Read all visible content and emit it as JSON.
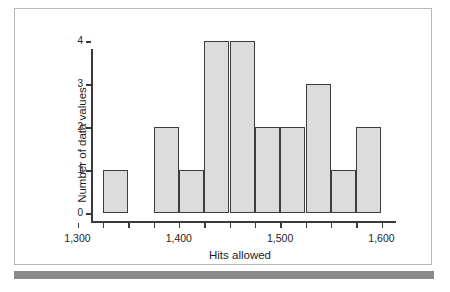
{
  "figure": {
    "frame_border_color": "#b9b9b9",
    "bottom_rule_color": "#8a8a8a",
    "background": "#ffffff"
  },
  "chart_data": {
    "type": "bar",
    "title": "",
    "subtitle": "",
    "xlabel": "Hits allowed",
    "ylabel": "Number of data values",
    "xlim": [
      1300,
      1600
    ],
    "ylim": [
      0,
      4
    ],
    "bin_width": 25,
    "grid": false,
    "legend": null,
    "bar_fill_color": "#dcdcdc",
    "bar_edge_color": "#3d3d3d",
    "x_tick_labels": [
      "1,300",
      "1,400",
      "1,500",
      "1,600"
    ],
    "x_tick_label_values": [
      1300,
      1400,
      1500,
      1600
    ],
    "x_minor_ticks": [
      1300,
      1325,
      1350,
      1375,
      1400,
      1425,
      1450,
      1475,
      1500,
      1525,
      1550,
      1575,
      1600
    ],
    "y_tick_labels": [
      "0",
      "1",
      "2",
      "3",
      "4"
    ],
    "y_tick_values": [
      0,
      1,
      2,
      3,
      4
    ],
    "bins": [
      {
        "start": 1300,
        "end": 1325,
        "count": 0
      },
      {
        "start": 1325,
        "end": 1350,
        "count": 1
      },
      {
        "start": 1350,
        "end": 1375,
        "count": 0
      },
      {
        "start": 1375,
        "end": 1400,
        "count": 2
      },
      {
        "start": 1400,
        "end": 1425,
        "count": 1
      },
      {
        "start": 1425,
        "end": 1450,
        "count": 4
      },
      {
        "start": 1450,
        "end": 1475,
        "count": 4
      },
      {
        "start": 1475,
        "end": 1500,
        "count": 2
      },
      {
        "start": 1500,
        "end": 1525,
        "count": 2
      },
      {
        "start": 1525,
        "end": 1550,
        "count": 3
      },
      {
        "start": 1550,
        "end": 1575,
        "count": 1
      },
      {
        "start": 1575,
        "end": 1600,
        "count": 2
      },
      {
        "start": 1600,
        "end": 1625,
        "count": 2
      },
      {
        "start": 1625,
        "end": 1650,
        "count": 1
      },
      {
        "start": 1650,
        "end": 1675,
        "count": 1
      }
    ],
    "categories": [
      "1325-1350",
      "1375-1400",
      "1400-1425",
      "1425-1450",
      "1450-1475",
      "1475-1500",
      "1500-1525",
      "1525-1550",
      "1550-1575",
      "1575-1600",
      "1600-1625",
      "1625-1650",
      "1650-1675"
    ],
    "values": [
      1,
      2,
      1,
      4,
      4,
      2,
      2,
      3,
      1,
      2,
      2,
      1,
      1
    ]
  }
}
